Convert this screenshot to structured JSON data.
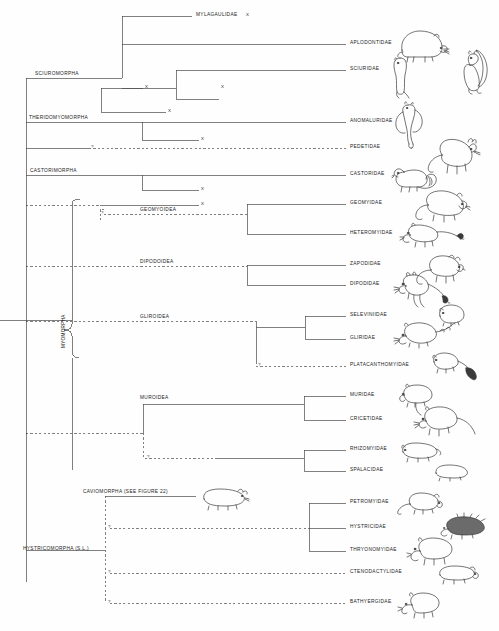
{
  "figure": {
    "type": "phylogenetic-cladogram",
    "background_color": "#fefefe",
    "line_color": "#4a4a4a",
    "text_color": "#1b1b1b"
  },
  "suborders": [
    {
      "id": "sciuromorpha",
      "label": "SCIUROMORPHA",
      "x": 35,
      "y": 78
    },
    {
      "id": "theridomyomorpha",
      "label": "THERIDOMYOMORPHA",
      "x": 29,
      "y": 122
    },
    {
      "id": "castorimorpha",
      "label": "CASTORIMORPHA",
      "x": 30,
      "y": 175
    },
    {
      "id": "myomorpha",
      "label": "MYOMORPHA",
      "x": 62,
      "y": 333,
      "vertical": true
    },
    {
      "id": "hystricomorpha",
      "label": "HYSTRICOMORPHA (S.L.)",
      "x": 23,
      "y": 550
    }
  ],
  "superfamilies": [
    {
      "id": "geomyoidea",
      "label": "GEOMYOIDEA",
      "x": 140,
      "y": 214
    },
    {
      "id": "dipodoidea",
      "label": "DIPODOIDEA",
      "x": 140,
      "y": 266
    },
    {
      "id": "gliroidea",
      "label": "GLIROIDEA",
      "x": 140,
      "y": 321
    },
    {
      "id": "muroidea",
      "label": "MUROIDEA",
      "x": 140,
      "y": 400
    }
  ],
  "cross_reference": {
    "id": "caviomorpha",
    "label": "CAVIOMORPHA (SEE FIGURE 22)",
    "x": 83,
    "y": 496
  },
  "families": [
    {
      "id": "mylagaulidae",
      "label": "MYLAGAULIDAE",
      "y": 16,
      "extinct": true,
      "extinct_mark": "X",
      "label_x": 196,
      "branch_from": 122,
      "branch_to": 192,
      "dashed": false,
      "has_illustration": false
    },
    {
      "id": "aplodontidae",
      "label": "APLODONTIDAE",
      "y": 44,
      "extinct": false,
      "label_x": 350,
      "branch_from": 122,
      "branch_to": 346,
      "dashed": false,
      "has_illustration": true
    },
    {
      "id": "sciuridae",
      "label": "SCIURIDAE",
      "y": 70,
      "extinct": false,
      "label_x": 350,
      "branch_from": 176,
      "branch_to": 346,
      "dashed": false,
      "has_illustration": true
    },
    {
      "id": "anomaluridae",
      "label": "ANOMALURIDAE",
      "y": 122,
      "extinct": false,
      "label_x": 350,
      "branch_from": 100,
      "branch_to": 346,
      "dashed": false,
      "has_illustration": true
    },
    {
      "id": "pedetidae",
      "label": "PEDETIDAE",
      "y": 148,
      "extinct": false,
      "label_x": 350,
      "branch_from": 144,
      "branch_to": 346,
      "dashed": true,
      "has_illustration": true
    },
    {
      "id": "castoridae",
      "label": "CASTORIDAE",
      "y": 175,
      "extinct": false,
      "label_x": 350,
      "branch_from": 100,
      "branch_to": 346,
      "dashed": false,
      "has_illustration": true
    },
    {
      "id": "geomyidae",
      "label": "GEOMYIDAE",
      "y": 204,
      "extinct": false,
      "label_x": 350,
      "branch_from": 247,
      "branch_to": 346,
      "dashed": false,
      "has_illustration": true
    },
    {
      "id": "heteromyidae",
      "label": "HETEROMYIDAE",
      "y": 234,
      "extinct": false,
      "label_x": 350,
      "branch_from": 247,
      "branch_to": 346,
      "dashed": false,
      "has_illustration": true
    },
    {
      "id": "zapodidae",
      "label": "ZAPODIDAE",
      "y": 265,
      "extinct": false,
      "label_x": 350,
      "branch_from": 247,
      "branch_to": 346,
      "dashed": false,
      "has_illustration": true
    },
    {
      "id": "dipodidae",
      "label": "DIPODIDAE",
      "y": 285,
      "extinct": false,
      "label_x": 350,
      "branch_from": 247,
      "branch_to": 346,
      "dashed": false,
      "has_illustration": true
    },
    {
      "id": "seleviniidae",
      "label": "SELEVINIIDAE",
      "y": 316,
      "extinct": false,
      "label_x": 350,
      "branch_from": 305,
      "branch_to": 346,
      "dashed": false,
      "has_illustration": false
    },
    {
      "id": "gliridae",
      "label": "GLIRIDAE",
      "y": 339,
      "extinct": false,
      "label_x": 350,
      "branch_from": 305,
      "branch_to": 346,
      "dashed": false,
      "has_illustration": true
    },
    {
      "id": "platacanthomyidae",
      "label": "PLATACANTHOMYIDAE",
      "y": 366,
      "extinct": false,
      "label_x": 350,
      "branch_from": 256,
      "branch_to": 346,
      "dashed": true,
      "has_illustration": true
    },
    {
      "id": "muridae",
      "label": "MURIDAE",
      "y": 396,
      "extinct": false,
      "label_x": 350,
      "branch_from": 304,
      "branch_to": 346,
      "dashed": false,
      "has_illustration": true
    },
    {
      "id": "cricetidae",
      "label": "CRICETIDAE",
      "y": 420,
      "extinct": false,
      "label_x": 350,
      "branch_from": 304,
      "branch_to": 346,
      "dashed": false,
      "has_illustration": true
    },
    {
      "id": "rhizomyidae",
      "label": "RHIZOMYIDAE",
      "y": 450,
      "extinct": false,
      "label_x": 350,
      "branch_from": 304,
      "branch_to": 346,
      "dashed": false,
      "has_illustration": true
    },
    {
      "id": "spalacidae",
      "label": "SPALACIDAE",
      "y": 471,
      "extinct": false,
      "label_x": 350,
      "branch_from": 304,
      "branch_to": 346,
      "dashed": false,
      "has_illustration": true
    },
    {
      "id": "petromyidae",
      "label": "PETROMYIDAE",
      "y": 503,
      "extinct": false,
      "label_x": 350,
      "branch_from": 309,
      "branch_to": 346,
      "dashed": false,
      "has_illustration": true
    },
    {
      "id": "hystricidae",
      "label": "HYSTRICIDAE",
      "y": 528,
      "extinct": false,
      "label_x": 350,
      "branch_from": 309,
      "branch_to": 346,
      "dashed": false,
      "has_illustration": true
    },
    {
      "id": "thryonomyidae",
      "label": "THRYONOMYIDAE",
      "y": 551,
      "extinct": false,
      "label_x": 350,
      "branch_from": 309,
      "branch_to": 346,
      "dashed": false,
      "has_illustration": true
    },
    {
      "id": "ctenodactylidae",
      "label": "CTENODACTYLIDAE",
      "y": 573,
      "extinct": false,
      "label_x": 350,
      "branch_from": 100,
      "branch_to": 346,
      "dashed": true,
      "has_illustration": true
    },
    {
      "id": "bathyergidae",
      "label": "BATHYERGIDAE",
      "y": 603,
      "extinct": false,
      "label_x": 350,
      "branch_from": 100,
      "branch_to": 346,
      "dashed": true,
      "has_illustration": true
    }
  ],
  "extinct_markers": [
    {
      "id": "extinct-mylagaulidae",
      "mark": "X",
      "x": 246,
      "y": 16
    },
    {
      "id": "extinct-sciuro-a",
      "mark": "X",
      "x": 222,
      "y": 88
    },
    {
      "id": "extinct-sciuro-b",
      "mark": "X",
      "x": 146,
      "y": 99
    },
    {
      "id": "extinct-sciuro-c",
      "mark": "X",
      "x": 169,
      "y": 112
    },
    {
      "id": "extinct-theridomy",
      "mark": "X",
      "x": 202,
      "y": 140
    },
    {
      "id": "extinct-castor",
      "mark": "X",
      "x": 202,
      "y": 190
    },
    {
      "id": "extinct-geomyoid",
      "mark": "X",
      "x": 202,
      "y": 205
    }
  ],
  "uncertainty_markers": [
    {
      "id": "uncertain-pedetidae",
      "mark": "?",
      "x": 92,
      "y": 147
    },
    {
      "id": "uncertain-geomyoidea",
      "mark": "?",
      "x": 101,
      "y": 213
    },
    {
      "id": "uncertain-platacanthomyidae",
      "mark": "?",
      "x": 258,
      "y": 365
    },
    {
      "id": "uncertain-rhizomyidae",
      "mark": "?",
      "x": 148,
      "y": 458
    },
    {
      "id": "uncertain-petromyidae",
      "mark": "?",
      "x": 107,
      "y": 528
    },
    {
      "id": "uncertain-ctenodactylidae",
      "mark": "?",
      "x": 107,
      "y": 573
    },
    {
      "id": "uncertain-bathyergidae",
      "mark": "?",
      "x": 107,
      "y": 603
    }
  ],
  "illustrations": [
    {
      "id": "aplodontia-illustration",
      "for": "aplodontidae",
      "x": 394,
      "y": 24,
      "w": 56,
      "h": 40,
      "kind": "mountain-beaver"
    },
    {
      "id": "squirrel-illustration",
      "for": "sciuridae",
      "x": 444,
      "y": 47,
      "w": 52,
      "h": 50,
      "kind": "squirrel"
    },
    {
      "id": "marmot-illustration",
      "for": "sciuridae",
      "x": 387,
      "y": 52,
      "w": 30,
      "h": 48,
      "kind": "ground-squirrel"
    },
    {
      "id": "anomalurus-illustration",
      "for": "anomaluridae",
      "x": 392,
      "y": 100,
      "w": 40,
      "h": 50,
      "kind": "scaly-tailed-squirrel"
    },
    {
      "id": "pedetes-illustration",
      "for": "pedetidae",
      "x": 424,
      "y": 133,
      "w": 58,
      "h": 44,
      "kind": "springhare"
    },
    {
      "id": "castor-illustration",
      "for": "castoridae",
      "x": 392,
      "y": 162,
      "w": 48,
      "h": 34,
      "kind": "beaver"
    },
    {
      "id": "geomys-illustration",
      "for": "geomyidae",
      "x": 414,
      "y": 185,
      "w": 56,
      "h": 42,
      "kind": "pocket-gopher"
    },
    {
      "id": "heteromys-illustration",
      "for": "heteromyidae",
      "x": 400,
      "y": 221,
      "w": 66,
      "h": 30,
      "kind": "kangaroo-rat"
    },
    {
      "id": "zapus-illustration",
      "for": "zapodidae",
      "x": 415,
      "y": 252,
      "w": 50,
      "h": 36,
      "kind": "jumping-mouse"
    },
    {
      "id": "dipus-illustration",
      "for": "dipodidae",
      "x": 392,
      "y": 272,
      "w": 60,
      "h": 40,
      "kind": "jerboa"
    },
    {
      "id": "selevinia-illustration",
      "for": "seleviniidae",
      "x": 434,
      "y": 302,
      "w": 34,
      "h": 26,
      "kind": "desert-dormouse"
    },
    {
      "id": "glis-illustration",
      "for": "gliridae",
      "x": 392,
      "y": 320,
      "w": 64,
      "h": 32,
      "kind": "dormouse"
    },
    {
      "id": "platacanthomys-illustration",
      "for": "platacanthomyidae",
      "x": 428,
      "y": 350,
      "w": 52,
      "h": 34,
      "kind": "spiny-dormouse"
    },
    {
      "id": "mus-illustration",
      "for": "muridae",
      "x": 396,
      "y": 383,
      "w": 48,
      "h": 34,
      "kind": "mouse"
    },
    {
      "id": "cricetus-illustration",
      "for": "cricetidae",
      "x": 414,
      "y": 405,
      "w": 62,
      "h": 38,
      "kind": "hamster"
    },
    {
      "id": "rhizomys-illustration",
      "for": "rhizomyidae",
      "x": 398,
      "y": 440,
      "w": 46,
      "h": 24,
      "kind": "bamboo-rat"
    },
    {
      "id": "spalax-illustration",
      "for": "spalacidae",
      "x": 432,
      "y": 462,
      "w": 40,
      "h": 22,
      "kind": "mole-rat"
    },
    {
      "id": "petromus-illustration",
      "for": "petromyidae",
      "x": 396,
      "y": 490,
      "w": 48,
      "h": 26,
      "kind": "dassie-rat"
    },
    {
      "id": "hystrix-illustration",
      "for": "hystricidae",
      "x": 438,
      "y": 515,
      "w": 52,
      "h": 26,
      "kind": "porcupine"
    },
    {
      "id": "thryonomys-illustration",
      "for": "thryonomyidae",
      "x": 406,
      "y": 535,
      "w": 52,
      "h": 32,
      "kind": "cane-rat"
    },
    {
      "id": "ctenodactylus-illustration",
      "for": "ctenodactylidae",
      "x": 434,
      "y": 563,
      "w": 46,
      "h": 24,
      "kind": "gundi"
    },
    {
      "id": "bathyergus-illustration",
      "for": "bathyergidae",
      "x": 396,
      "y": 590,
      "w": 50,
      "h": 30,
      "kind": "blesmol"
    },
    {
      "id": "cavia-illustration",
      "for": "caviomorpha",
      "x": 196,
      "y": 486,
      "w": 54,
      "h": 26,
      "kind": "guinea-pig"
    }
  ]
}
